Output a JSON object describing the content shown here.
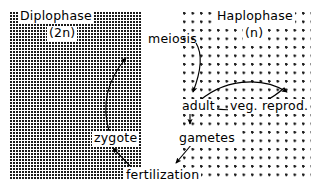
{
  "figure": {
    "width": 319,
    "height": 195,
    "background": "#ffffff",
    "ink": "#000000"
  },
  "regions": [
    {
      "key": "diplophase",
      "label": "Diplophase",
      "ploidy": "(2n)",
      "fill_pattern": "dense-stipple",
      "fill_color": "#1a1a1a",
      "x": 10,
      "y": 12,
      "width": 131,
      "height": 168
    },
    {
      "key": "haplophase",
      "label": "Haplophase",
      "ploidy": "(n)",
      "fill_pattern": "sparse-dots",
      "fill_color": "#1a1a1a",
      "x": 183,
      "y": 12,
      "width": 128,
      "height": 170
    }
  ],
  "nodes": [
    {
      "key": "zygote",
      "label": "zygote",
      "phase": "diplophase"
    },
    {
      "key": "adult",
      "label": "adult",
      "phase": "haplophase"
    },
    {
      "key": "veg_reprod",
      "label": "veg. reprod.",
      "phase": "haplophase"
    },
    {
      "key": "gametes",
      "label": "gametes",
      "phase": "haplophase"
    }
  ],
  "processes": [
    {
      "key": "meiosis",
      "label": "meiosis",
      "between": "diplophase-to-haplophase"
    },
    {
      "key": "fertilization",
      "label": "fertilization",
      "between": "haplophase-to-diplophase"
    }
  ],
  "edges": [
    {
      "key": "zygote-to-meiosis",
      "from": "zygote",
      "to": "meiosis",
      "style": "curved-arrow"
    },
    {
      "key": "meiosis-to-adult",
      "from": "meiosis",
      "to": "adult",
      "style": "curved-arrow"
    },
    {
      "key": "adult-to-veg-reprod",
      "from": "adult",
      "to": "veg_reprod",
      "style": "curved-arrow"
    },
    {
      "key": "veg-reprod-to-adult",
      "from": "veg_reprod",
      "to": "adult",
      "style": "curved-arrow"
    },
    {
      "key": "adult-to-gametes",
      "from": "adult",
      "to": "gametes",
      "style": "straight-arrow"
    },
    {
      "key": "gametes-to-fertilization",
      "from": "gametes",
      "to": "fertilization",
      "style": "straight-arrow"
    },
    {
      "key": "fertilization-to-zygote",
      "from": "fertilization",
      "to": "zygote",
      "style": "straight-arrow"
    }
  ]
}
